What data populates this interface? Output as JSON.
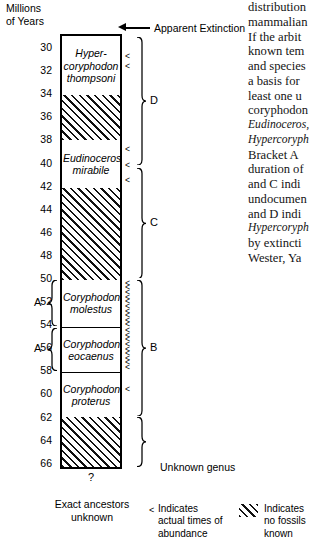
{
  "figure": {
    "axis_title": "Millions\nof Years",
    "axis_title_line1": "Millions",
    "axis_title_line2": "of Years",
    "axis_unit": "Millions of Years",
    "axis_min": 29,
    "axis_max": 66.5,
    "tick_labels": [
      "30",
      "32",
      "34",
      "36",
      "38",
      "40",
      "42",
      "44",
      "46",
      "48",
      "50",
      "52",
      "54",
      "56",
      "58",
      "60",
      "62",
      "64",
      "66"
    ],
    "apparent_extinction_label": "Apparent Extinction",
    "unknown_genus_label": "Unknown genus",
    "question_mark": "?",
    "exact_ancestors_line1": "Exact ancestors",
    "exact_ancestors_line2": "unknown"
  },
  "chart_data": {
    "type": "range-chart",
    "xlabel": "",
    "ylabel": "Millions of Years",
    "ylim": [
      29,
      66.5
    ],
    "y_inverted": true,
    "grid": false,
    "legend_position": "bottom",
    "bands": [
      {
        "taxon": "Hyper-coryphodon thompsoni",
        "label_lines": [
          "Hyper-",
          "coryphodon",
          "thompsoni"
        ],
        "from": 29.0,
        "to": 34.1,
        "fossils": true,
        "fill": "white"
      },
      {
        "taxon": "",
        "label_lines": [],
        "from": 34.1,
        "to": 38.0,
        "fossils": false,
        "fill": "hatched"
      },
      {
        "taxon": "Eudinoceros mirabile",
        "label_lines": [
          "Eudinoceros",
          "mirabile"
        ],
        "from": 38.0,
        "to": 42.2,
        "fossils": true,
        "fill": "white"
      },
      {
        "taxon": "",
        "label_lines": [],
        "from": 42.2,
        "to": 50.1,
        "fossils": false,
        "fill": "hatched"
      },
      {
        "taxon": "Coryphodon molestus",
        "label_lines": [
          "Coryphodon",
          "molestus"
        ],
        "from": 50.1,
        "to": 54.2,
        "fossils": true,
        "fill": "white"
      },
      {
        "taxon": "Coryphodon eocaenus",
        "label_lines": [
          "Coryphodon",
          "eocaenus"
        ],
        "from": 54.2,
        "to": 58.1,
        "fossils": true,
        "fill": "white"
      },
      {
        "taxon": "Coryphodon proterus",
        "label_lines": [
          "Coryphodon",
          "proterus"
        ],
        "from": 58.1,
        "to": 62.0,
        "fossils": true,
        "fill": "white"
      },
      {
        "taxon": "",
        "label_lines": [],
        "from": 62.0,
        "to": 66.3,
        "fossils": false,
        "fill": "hatched"
      }
    ],
    "abundance_marker": "<",
    "abundance_marks_myr": [
      30.8,
      31.6,
      38.8,
      40.2,
      41.5,
      50.4,
      50.8,
      51.2,
      51.6,
      52.0,
      52.4,
      52.8,
      53.2,
      53.6,
      54.0,
      54.5,
      54.9,
      55.3,
      55.7,
      56.1,
      56.5,
      56.9,
      57.3,
      57.7,
      59.6
    ],
    "brackets_right": [
      {
        "label": "D",
        "from": 29.1,
        "to": 40.2
      },
      {
        "label": "C",
        "from": 40.4,
        "to": 50.0
      },
      {
        "label": "B",
        "from": 50.1,
        "to": 61.9
      },
      {
        "label": "",
        "from": 62.0,
        "to": 66.3,
        "annotation": "Unknown genus"
      }
    ],
    "brackets_left": [
      {
        "label": "A",
        "from": 50.1,
        "to": 54.1
      },
      {
        "label": "A",
        "from": 54.3,
        "to": 58.0
      }
    ]
  },
  "legend": {
    "caret_symbol": "<",
    "caret_lines": [
      "Indicates",
      "actual times of",
      "abundance"
    ],
    "hatch_lines": [
      "Indicates",
      "no fossils",
      "known"
    ]
  },
  "body_text": {
    "lines": [
      "distribution",
      "mammalian",
      "If the arbit",
      "known tem",
      "and species",
      "a basis for",
      "least one u",
      "coryphodon",
      "Eudinoceros,",
      "Hypercoryph",
      "Bracket A",
      "duration of",
      "and C indi",
      "undocumen",
      "and D indi",
      "Hypercoryph",
      "by extincti",
      "Wester, Ya"
    ],
    "italic_line_indices": [
      8,
      9,
      15
    ]
  }
}
